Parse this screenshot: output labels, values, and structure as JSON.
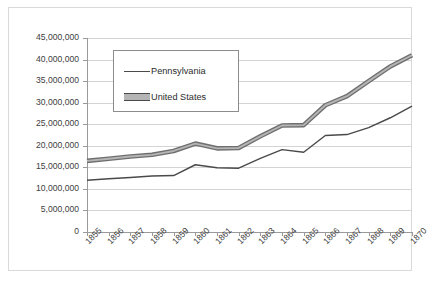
{
  "chart_data": {
    "type": "line",
    "title": "",
    "xlabel": "",
    "ylabel": "",
    "ylim": [
      0,
      45000000
    ],
    "ytick_values": [
      0,
      5000000,
      10000000,
      15000000,
      20000000,
      25000000,
      30000000,
      35000000,
      40000000,
      45000000
    ],
    "ytick_labels": [
      "0",
      "5,000,000",
      "10,000,000",
      "15,000,000",
      "20,000,000",
      "25,000,000",
      "30,000,000",
      "35,000,000",
      "40,000,000",
      "45,000,000"
    ],
    "categories": [
      "1855",
      "1856",
      "1857",
      "1858",
      "1859",
      "1860",
      "1861",
      "1862",
      "1863",
      "1864",
      "1865",
      "1866",
      "1867",
      "1868",
      "1869",
      "1870"
    ],
    "x": [
      1855,
      1856,
      1857,
      1858,
      1859,
      1860,
      1861,
      1862,
      1863,
      1864,
      1865,
      1866,
      1867,
      1868,
      1869,
      1870
    ],
    "grid": true,
    "legend_position": "upper-center",
    "series": [
      {
        "name": "Pennsylvania",
        "style": "thin-line",
        "color": "#4a4a4a",
        "values": [
          12000000,
          12350000,
          12650000,
          13000000,
          13100000,
          15600000,
          14900000,
          14800000,
          17100000,
          19100000,
          18500000,
          22400000,
          22600000,
          24200000,
          26500000,
          29200000
        ]
      },
      {
        "name": "United States",
        "style": "thick-band-line",
        "color": "#6f6f6f",
        "fill": "#b5b5b5",
        "values": [
          16500000,
          17000000,
          17500000,
          17900000,
          18800000,
          20500000,
          19400000,
          19500000,
          22200000,
          24700000,
          24800000,
          29400000,
          31500000,
          35000000,
          38400000,
          41000000
        ]
      }
    ]
  },
  "legend": {
    "items": [
      {
        "label": "Pennsylvania",
        "marker": "thin-line-swatch"
      },
      {
        "label": "United States",
        "marker": "thick-band-swatch"
      }
    ]
  },
  "colors": {
    "grid": "#d4d4d4",
    "axis": "#9a9a9a",
    "frame": "#d9d9d9",
    "text": "#404040",
    "pennsylvania": "#4a4a4a",
    "united_states": "#6f6f6f",
    "united_states_fill": "#b5b5b5",
    "background": "#ffffff"
  }
}
